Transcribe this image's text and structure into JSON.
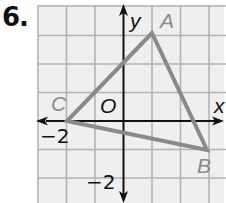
{
  "problem": {
    "number": "6."
  },
  "graph": {
    "axis_labels": {
      "x": "x",
      "y": "y",
      "origin": "O"
    },
    "tick_labels": {
      "x_neg2": "−2",
      "y_neg2": "−2"
    },
    "grid": {
      "unit_px": 28.5,
      "origin_px": [
        123.5,
        121
      ],
      "x_range": [
        -3,
        3
      ],
      "y_range": [
        -2,
        4
      ]
    },
    "colors": {
      "grid": "#b3b3b3",
      "grid_bg": "#efefef",
      "axis": "#111111",
      "triangle": "#8a8a8a",
      "vertex_label": "#8a8a8a"
    },
    "points": [
      {
        "label": "A",
        "x": 1,
        "y": 3
      },
      {
        "label": "B",
        "x": 3,
        "y": -1
      },
      {
        "label": "C",
        "x": -2,
        "y": 0
      }
    ]
  }
}
